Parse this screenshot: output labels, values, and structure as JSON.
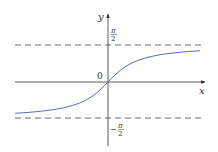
{
  "chart_data": {
    "type": "line",
    "title": "",
    "function": "y = arctan(x)",
    "xlabel": "x",
    "ylabel": "y",
    "origin_label": "0",
    "asymptotes": [
      {
        "value": 1.5708,
        "label_num": "π",
        "label_den": "2",
        "sign": ""
      },
      {
        "value": -1.5708,
        "label_num": "π",
        "label_den": "2",
        "sign": "−"
      }
    ],
    "series": [
      {
        "name": "arctan",
        "color": "#5b6fbf",
        "x": [
          -4,
          -3,
          -2,
          -1,
          -0.5,
          0,
          0.5,
          1,
          2,
          3,
          4
        ],
        "y": [
          -1.326,
          -1.249,
          -1.107,
          -0.785,
          -0.464,
          0,
          0.464,
          0.785,
          1.107,
          1.249,
          1.326
        ]
      }
    ],
    "xlim": [
      -4,
      4
    ],
    "ylim": [
      -2.8,
      2.9
    ],
    "grid": false,
    "legend": null
  },
  "colors": {
    "axis": "#333333",
    "curve": "#5b6fbf",
    "asymptote": "#444444"
  }
}
